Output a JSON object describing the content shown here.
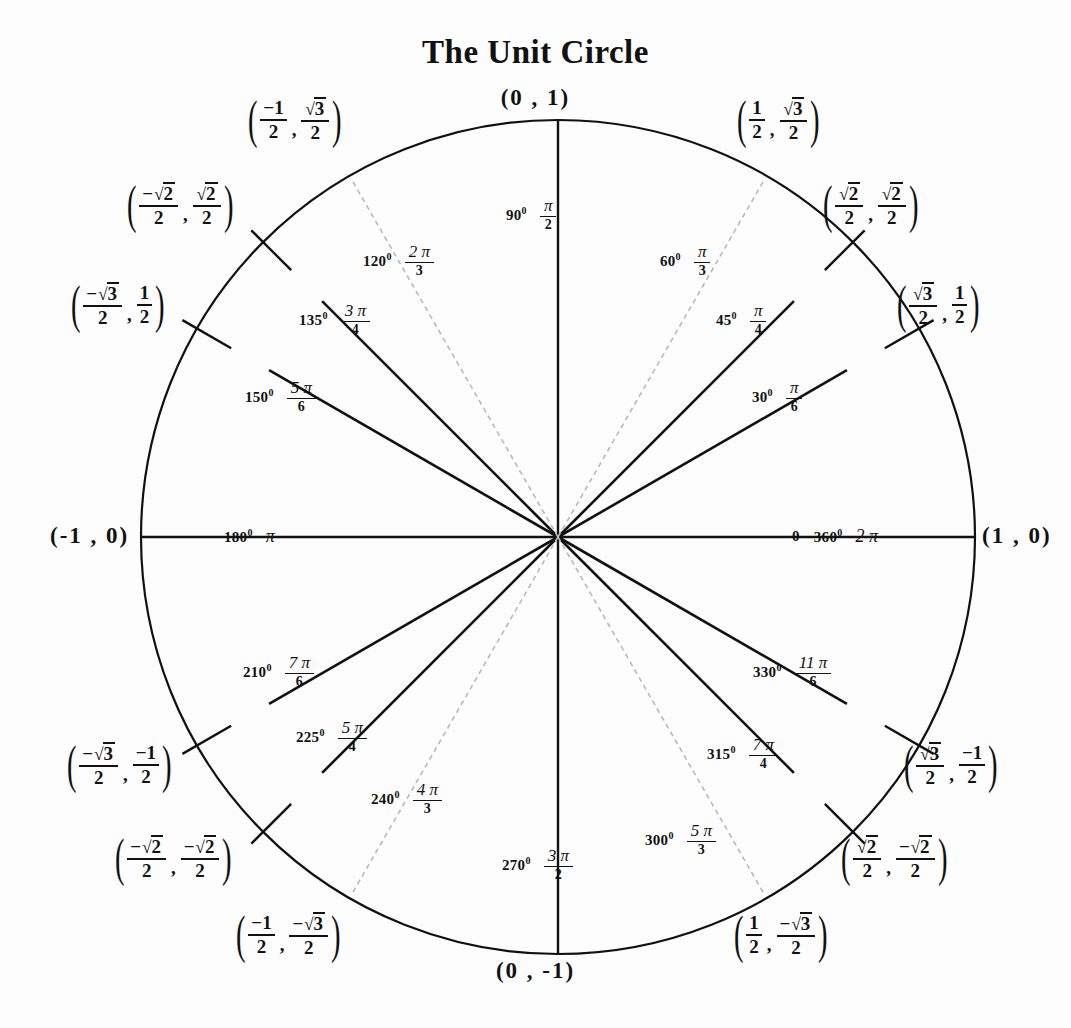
{
  "title": "The Unit Circle",
  "geometry": {
    "center_x": 558,
    "center_y": 537,
    "radius": 417,
    "stroke_dark": "#111111",
    "stroke_faint": "#b9b9b9"
  },
  "axis_points": {
    "top": "(0 , 1)",
    "bottom": "(0 , -1)",
    "left": "(-1 , 0)",
    "right": "(1 , 0)"
  },
  "axis_angles": {
    "left": {
      "degrees": "180",
      "radian_text": "π"
    },
    "right": {
      "degrees_zero": "0",
      "degrees": "360",
      "radian_text": "2 π"
    },
    "top": {
      "degrees": "90",
      "radian_num": "π",
      "radian_den": "2"
    },
    "bottom": {
      "degrees": "270",
      "radian_num": "3 π",
      "radian_den": "2"
    }
  },
  "chart_data": {
    "type": "scatter",
    "title": "The Unit Circle",
    "xlabel": "",
    "ylabel": "",
    "xlim": [
      -1,
      1
    ],
    "ylim": [
      -1,
      1
    ],
    "grid": false,
    "legend": "none",
    "points": [
      {
        "degrees": 0,
        "radians": "2π",
        "x": 1,
        "y": 0,
        "quadrant": "axis"
      },
      {
        "degrees": 30,
        "radians": "π/6",
        "x": 0.866,
        "y": 0.5,
        "quadrant": "I"
      },
      {
        "degrees": 45,
        "radians": "π/4",
        "x": 0.7071,
        "y": 0.7071,
        "quadrant": "I"
      },
      {
        "degrees": 60,
        "radians": "π/3",
        "x": 0.5,
        "y": 0.866,
        "quadrant": "I"
      },
      {
        "degrees": 90,
        "radians": "π/2",
        "x": 0,
        "y": 1,
        "quadrant": "axis"
      },
      {
        "degrees": 120,
        "radians": "2π/3",
        "x": -0.5,
        "y": 0.866,
        "quadrant": "II"
      },
      {
        "degrees": 135,
        "radians": "3π/4",
        "x": -0.7071,
        "y": 0.7071,
        "quadrant": "II"
      },
      {
        "degrees": 150,
        "radians": "5π/6",
        "x": -0.866,
        "y": 0.5,
        "quadrant": "II"
      },
      {
        "degrees": 180,
        "radians": "π",
        "x": -1,
        "y": 0,
        "quadrant": "axis"
      },
      {
        "degrees": 210,
        "radians": "7π/6",
        "x": -0.866,
        "y": -0.5,
        "quadrant": "III"
      },
      {
        "degrees": 225,
        "radians": "5π/4",
        "x": -0.7071,
        "y": -0.7071,
        "quadrant": "III"
      },
      {
        "degrees": 240,
        "radians": "4π/3",
        "x": -0.5,
        "y": -0.866,
        "quadrant": "III"
      },
      {
        "degrees": 270,
        "radians": "3π/2",
        "x": 0,
        "y": -1,
        "quadrant": "axis"
      },
      {
        "degrees": 300,
        "radians": "5π/3",
        "x": 0.5,
        "y": -0.866,
        "quadrant": "IV"
      },
      {
        "degrees": 315,
        "radians": "7π/4",
        "x": 0.7071,
        "y": -0.7071,
        "quadrant": "IV"
      },
      {
        "degrees": 330,
        "radians": "11π/6",
        "x": 0.866,
        "y": -0.5,
        "quadrant": "IV"
      }
    ]
  },
  "angle_labels": [
    {
      "id": "a30",
      "degrees": "30",
      "num": "π",
      "den": "6",
      "left": 752,
      "top": 379
    },
    {
      "id": "a45",
      "degrees": "45",
      "num": "π",
      "den": "4",
      "left": 716,
      "top": 302
    },
    {
      "id": "a60",
      "degrees": "60",
      "num": "π",
      "den": "3",
      "left": 660,
      "top": 243
    },
    {
      "id": "a120",
      "degrees": "120",
      "num": "2 π",
      "den": "3",
      "left": 363,
      "top": 243
    },
    {
      "id": "a135",
      "degrees": "135",
      "num": "3 π",
      "den": "4",
      "left": 299,
      "top": 302
    },
    {
      "id": "a150",
      "degrees": "150",
      "num": "5 π",
      "den": "6",
      "left": 245,
      "top": 379
    },
    {
      "id": "a210",
      "degrees": "210",
      "num": "7 π",
      "den": "6",
      "left": 243,
      "top": 654
    },
    {
      "id": "a225",
      "degrees": "225",
      "num": "5 π",
      "den": "4",
      "left": 296,
      "top": 719
    },
    {
      "id": "a240",
      "degrees": "240",
      "num": "4 π",
      "den": "3",
      "left": 371,
      "top": 781
    },
    {
      "id": "a300",
      "degrees": "300",
      "num": "5 π",
      "den": "3",
      "left": 645,
      "top": 822
    },
    {
      "id": "a315",
      "degrees": "315",
      "num": "7 π",
      "den": "4",
      "left": 707,
      "top": 736
    },
    {
      "id": "a330",
      "degrees": "330",
      "num": "11 π",
      "den": "6",
      "left": 753,
      "top": 654
    }
  ],
  "coords": [
    {
      "id": "c30",
      "left": 896,
      "top": 282,
      "xn": "√3",
      "xd": "2",
      "yn": "1",
      "yd": "2",
      "xrad": true,
      "yrad": false,
      "xneg": false,
      "yneg": false
    },
    {
      "id": "c45",
      "left": 822,
      "top": 182,
      "xn": "√2",
      "xd": "2",
      "yn": "√2",
      "yd": "2",
      "xrad": true,
      "yrad": true,
      "xneg": false,
      "yneg": false
    },
    {
      "id": "c60",
      "left": 736,
      "top": 97,
      "xn": "1",
      "xd": "2",
      "yn": "√3",
      "yd": "2",
      "xrad": false,
      "yrad": true,
      "xneg": false,
      "yneg": false
    },
    {
      "id": "c120",
      "left": 247,
      "top": 97,
      "xn": "1",
      "xd": "2",
      "yn": "√3",
      "yd": "2",
      "xrad": false,
      "yrad": true,
      "xneg": true,
      "yneg": false
    },
    {
      "id": "c135",
      "left": 126,
      "top": 182,
      "xn": "√2",
      "xd": "2",
      "yn": "√2",
      "yd": "2",
      "xrad": true,
      "yrad": true,
      "xneg": true,
      "yneg": false
    },
    {
      "id": "c150",
      "left": 70,
      "top": 282,
      "xn": "√3",
      "xd": "2",
      "yn": "1",
      "yd": "2",
      "xrad": true,
      "yrad": false,
      "xneg": true,
      "yneg": false
    },
    {
      "id": "c210",
      "left": 66,
      "top": 742,
      "xn": "√3",
      "xd": "2",
      "yn": "1",
      "yd": "2",
      "xrad": true,
      "yrad": false,
      "xneg": true,
      "yneg": true
    },
    {
      "id": "c225",
      "left": 114,
      "top": 835,
      "xn": "√2",
      "xd": "2",
      "yn": "√2",
      "yd": "2",
      "xrad": true,
      "yrad": true,
      "xneg": true,
      "yneg": true
    },
    {
      "id": "c240",
      "left": 235,
      "top": 912,
      "xn": "1",
      "xd": "2",
      "yn": "√3",
      "yd": "2",
      "xrad": false,
      "yrad": true,
      "xneg": true,
      "yneg": true
    },
    {
      "id": "c300",
      "left": 733,
      "top": 912,
      "xn": "1",
      "xd": "2",
      "yn": "√3",
      "yd": "2",
      "xrad": false,
      "yrad": true,
      "xneg": false,
      "yneg": true
    },
    {
      "id": "c315",
      "left": 840,
      "top": 835,
      "xn": "√2",
      "xd": "2",
      "yn": "√2",
      "yd": "2",
      "xrad": true,
      "yrad": true,
      "xneg": false,
      "yneg": true
    },
    {
      "id": "c330",
      "left": 903,
      "top": 742,
      "xn": "√3",
      "xd": "2",
      "yn": "1",
      "yd": "2",
      "xrad": true,
      "yrad": false,
      "xneg": false,
      "yneg": true
    }
  ]
}
